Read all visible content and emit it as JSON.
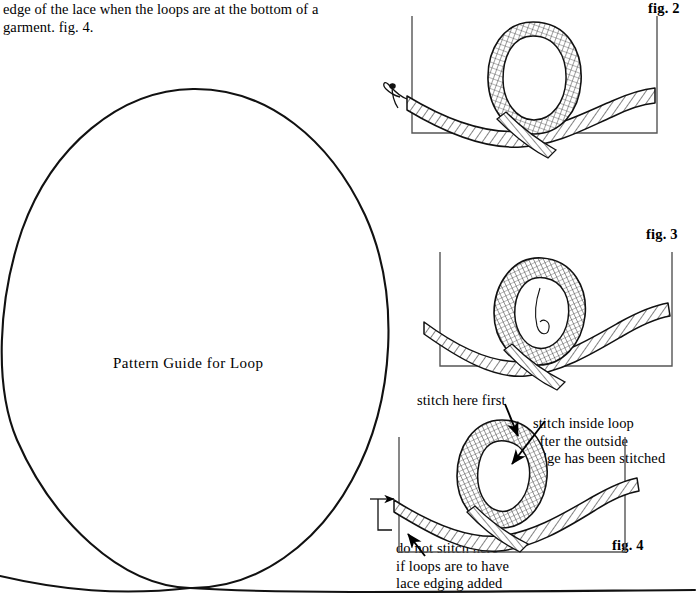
{
  "document": {
    "type": "instructional-sewing-diagram-page",
    "intro_text": "edge of the lace when the loops are at the bottom of a\ngarment. fig. 4.",
    "pattern_guide_label": "Pattern Guide for Loop",
    "ink_color": "#000000",
    "background_color": "#ffffff"
  },
  "figures": [
    {
      "id": "fig2",
      "label": "fig. 2",
      "caption": "",
      "description": "lace ribbon forming a single loop crossing itself, drawn inside a three-sided frame, with a needle and thread at the left end"
    },
    {
      "id": "fig3",
      "label": "fig. 3",
      "caption": "",
      "description": "lace ribbon loop pulled tighter and upright, drawn inside a three-sided frame"
    },
    {
      "id": "fig4",
      "label": "fig. 4",
      "caption": "",
      "description": "lace ribbon loop with stitching annotations and arrows"
    }
  ],
  "annotations": {
    "stitch_here_first": "stitch here first",
    "stitch_inside_loop": "stitch inside loop\nafter the outside\nedge has been stitched",
    "do_not_stitch_here": "do not stitch here\nif loops are to have\nlace edging added"
  }
}
